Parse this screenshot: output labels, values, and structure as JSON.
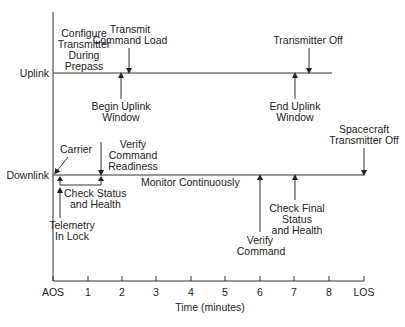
{
  "diagram": {
    "title": "",
    "colors": {
      "ink": "#222222",
      "line": "#333333",
      "background": "#ffffff"
    },
    "tracks": [
      {
        "id": "uplink",
        "label": "Uplink"
      },
      {
        "id": "downlink",
        "label": "Downlink"
      }
    ],
    "axis": {
      "xlabel": "Time (minutes)",
      "ticks": [
        "AOS",
        "1",
        "2",
        "3",
        "4",
        "5",
        "6",
        "7",
        "8",
        "LOS"
      ]
    },
    "uplink_events": {
      "configure": [
        "Configure",
        "Transmitter",
        "During",
        "Prepass"
      ],
      "transmit_load": [
        "Transmit",
        "Command Load"
      ],
      "begin_window": [
        "Begin Uplink",
        "Window"
      ],
      "transmitter_off": [
        "Transmitter Off"
      ],
      "end_window": [
        "End Uplink",
        "Window"
      ]
    },
    "downlink_events": {
      "carrier": [
        "Carrier"
      ],
      "verify_readiness": [
        "Verify",
        "Command",
        "Readiness"
      ],
      "check_status": [
        "Check Status",
        "and Health"
      ],
      "telemetry_lock": [
        "Telemetry",
        "In Lock"
      ],
      "monitor": [
        "Monitor Continuously"
      ],
      "verify_command": [
        "Verify",
        "Command"
      ],
      "check_final": [
        "Check Final",
        "Status",
        "and Health"
      ],
      "spacecraft_off": [
        "Spacecraft",
        "Transmitter Off"
      ]
    }
  }
}
